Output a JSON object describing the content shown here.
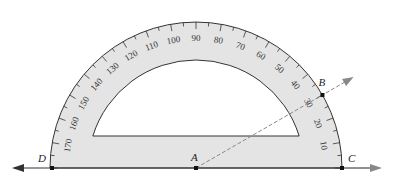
{
  "diagram": {
    "type": "protractor-angle-measurement",
    "colors": {
      "protractor_fill": "#e4e4e4",
      "outline": "#333333",
      "ray": "#888888",
      "line": "#333333"
    },
    "points": [
      {
        "name": "D",
        "x": 52,
        "y": 168
      },
      {
        "name": "A",
        "x": 196,
        "y": 168
      },
      {
        "name": "B",
        "x": 322,
        "y": 95
      },
      {
        "name": "C",
        "x": 342,
        "y": 168
      }
    ],
    "scale_labels": [
      "10",
      "20",
      "30",
      "40",
      "50",
      "60",
      "70",
      "80",
      "90",
      "100",
      "110",
      "120",
      "130",
      "140",
      "150",
      "160",
      "170"
    ],
    "ray_AB": {
      "style": "dashed",
      "angle_deg": 30
    },
    "line_DC": {
      "style": "solid",
      "arrows": "both"
    }
  }
}
